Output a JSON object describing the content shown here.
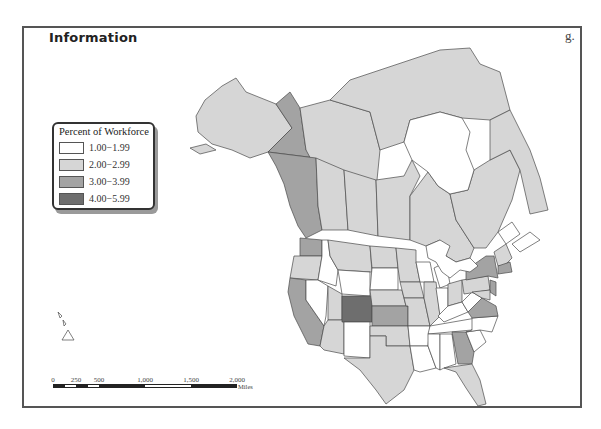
{
  "map": {
    "title": "Information",
    "panel_letter": "g.",
    "legend": {
      "title": "Percent of Workforce",
      "classes": [
        {
          "label": "1.00−1.99",
          "color": "#ffffff"
        },
        {
          "label": "2.00−2.99",
          "color": "#d6d6d6"
        },
        {
          "label": "3.00−3.99",
          "color": "#a3a3a3"
        },
        {
          "label": "4.00−5.99",
          "color": "#6e6e6e"
        }
      ]
    },
    "scale_bar": {
      "ticks": [
        "0",
        "250",
        "500",
        "1,000",
        "1,500",
        "2,000"
      ],
      "unit": "Miles"
    },
    "regions": [
      {
        "name": "Alaska",
        "class": 1
      },
      {
        "name": "Yukon",
        "class": 2
      },
      {
        "name": "Northwest Territories",
        "class": 1
      },
      {
        "name": "Nunavut",
        "class": 1
      },
      {
        "name": "British Columbia",
        "class": 2
      },
      {
        "name": "Alberta",
        "class": 1
      },
      {
        "name": "Saskatchewan",
        "class": 1
      },
      {
        "name": "Manitoba",
        "class": 1
      },
      {
        "name": "Ontario",
        "class": 1
      },
      {
        "name": "Quebec",
        "class": 1
      },
      {
        "name": "Newfoundland and Labrador",
        "class": 1
      },
      {
        "name": "New Brunswick",
        "class": 0
      },
      {
        "name": "Nova Scotia",
        "class": 0
      },
      {
        "name": "Washington",
        "class": 2
      },
      {
        "name": "Oregon",
        "class": 1
      },
      {
        "name": "California",
        "class": 2
      },
      {
        "name": "Nevada",
        "class": 0
      },
      {
        "name": "Idaho",
        "class": 0
      },
      {
        "name": "Montana",
        "class": 1
      },
      {
        "name": "Wyoming",
        "class": 0
      },
      {
        "name": "Utah",
        "class": 1
      },
      {
        "name": "Arizona",
        "class": 1
      },
      {
        "name": "Colorado",
        "class": 3
      },
      {
        "name": "New Mexico",
        "class": 0
      },
      {
        "name": "North Dakota",
        "class": 1
      },
      {
        "name": "South Dakota",
        "class": 0
      },
      {
        "name": "Nebraska",
        "class": 1
      },
      {
        "name": "Kansas",
        "class": 2
      },
      {
        "name": "Oklahoma",
        "class": 1
      },
      {
        "name": "Texas",
        "class": 1
      },
      {
        "name": "Minnesota",
        "class": 1
      },
      {
        "name": "Iowa",
        "class": 1
      },
      {
        "name": "Missouri",
        "class": 1
      },
      {
        "name": "Arkansas",
        "class": 0
      },
      {
        "name": "Louisiana",
        "class": 0
      },
      {
        "name": "Wisconsin",
        "class": 0
      },
      {
        "name": "Illinois",
        "class": 1
      },
      {
        "name": "Michigan",
        "class": 0
      },
      {
        "name": "Indiana",
        "class": 0
      },
      {
        "name": "Ohio",
        "class": 1
      },
      {
        "name": "Kentucky",
        "class": 0
      },
      {
        "name": "Tennessee",
        "class": 0
      },
      {
        "name": "Mississippi",
        "class": 0
      },
      {
        "name": "Alabama",
        "class": 0
      },
      {
        "name": "Georgia",
        "class": 2
      },
      {
        "name": "Florida",
        "class": 1
      },
      {
        "name": "South Carolina",
        "class": 0
      },
      {
        "name": "North Carolina",
        "class": 0
      },
      {
        "name": "Virginia",
        "class": 2
      },
      {
        "name": "West Virginia",
        "class": 0
      },
      {
        "name": "Pennsylvania",
        "class": 1
      },
      {
        "name": "New York",
        "class": 2
      },
      {
        "name": "New Jersey",
        "class": 2
      },
      {
        "name": "Maryland",
        "class": 1
      },
      {
        "name": "New England",
        "class": 1
      },
      {
        "name": "Massachusetts",
        "class": 2
      },
      {
        "name": "Hawaii",
        "class": 0
      }
    ]
  }
}
